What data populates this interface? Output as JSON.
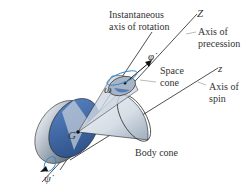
{
  "labels": {
    "instantaneous_axis_line1": "Instantaneous",
    "instantaneous_axis_line2": "axis of rotation",
    "Z": "Z",
    "axis_precession_line1": "Axis of",
    "axis_precession_line2": "precession",
    "phi_dot": "φ̇",
    "space_cone_line1": "Space",
    "space_cone_line2": "cone",
    "z": "z",
    "axis_spin_line1": "Axis of",
    "axis_spin_line2": "spin",
    "omega": "ω",
    "G": "G",
    "body_cone": "Body cone",
    "psi_dot": "ψ̇"
  },
  "colors": {
    "disk_blue": "#3f6fb5",
    "disk_dark": "#2b4f86",
    "disk_rim": "#a9b3bf",
    "cone_light": "#dfe5ec",
    "cone_shade": "#b9c4d1",
    "arrow_blue": "#2f86c9",
    "line": "#222222",
    "text": "#333333"
  }
}
